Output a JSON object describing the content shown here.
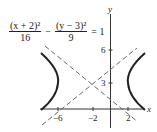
{
  "equation": {
    "term1_numerator": "(x + 2)²",
    "term1_denominator": "16",
    "minus": "−",
    "term2_numerator": "(y − 3)²",
    "term2_denominator": "9",
    "rhs": "= 1"
  },
  "axes": {
    "x_label": "x",
    "y_label": "y",
    "x_ticks": [
      {
        "value": -6,
        "label": "−6"
      },
      {
        "value": -2,
        "label": "−2"
      },
      {
        "value": 2,
        "label": "2"
      }
    ],
    "y_ticks": [
      {
        "value": 3,
        "label": "3"
      },
      {
        "value": 6,
        "label": "6"
      }
    ]
  },
  "hyperbola": {
    "center": [
      -2,
      3
    ],
    "a": 4,
    "b": 3,
    "orientation": "horizontal",
    "asymptote_slopes": [
      0.75,
      -0.75
    ],
    "curve_color": "#222222",
    "asymptote_color": "#666666",
    "asymptote_style": "dashed"
  }
}
